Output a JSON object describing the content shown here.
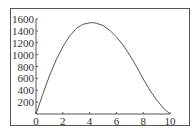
{
  "chart_data": {
    "type": "line",
    "title": "",
    "xlabel": "",
    "ylabel": "",
    "xlim": [
      0,
      10
    ],
    "ylim": [
      0,
      1600
    ],
    "x_ticks": [
      "0",
      "2",
      "4",
      "6",
      "8",
      "10"
    ],
    "y_ticks": [
      "200",
      "400",
      "600",
      "800",
      "1000",
      "1200",
      "1400",
      "1600"
    ],
    "grid": false,
    "legend": null,
    "series": [
      {
        "name": "curve",
        "x": [
          0,
          0.5,
          1,
          1.5,
          2,
          2.5,
          3,
          3.5,
          4,
          4.2,
          4.5,
          5,
          5.5,
          6,
          6.5,
          7,
          7.5,
          8,
          8.5,
          9,
          9.5,
          10
        ],
        "y": [
          0,
          330,
          640,
          910,
          1130,
          1310,
          1440,
          1510,
          1535,
          1540,
          1530,
          1490,
          1410,
          1300,
          1160,
          990,
          800,
          590,
          400,
          240,
          100,
          0
        ]
      }
    ],
    "line_color": "#555555"
  }
}
